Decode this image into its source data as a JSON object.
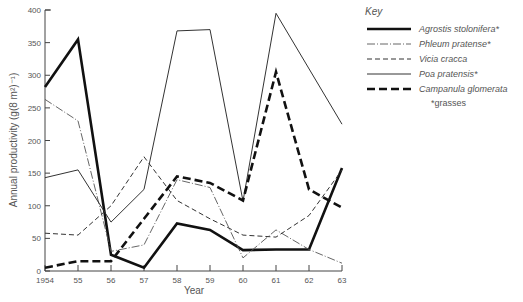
{
  "chart_data": {
    "type": "line",
    "title": "",
    "xlabel": "Year",
    "ylabel": "Annual productivity (g(8 m²)⁻¹)",
    "ylim": [
      0,
      400
    ],
    "yticks": [
      0,
      50,
      100,
      150,
      200,
      250,
      300,
      350,
      400
    ],
    "categories": [
      "1954",
      "55",
      "56",
      "57",
      "58",
      "59",
      "60",
      "61",
      "62",
      "63"
    ],
    "grid": false,
    "legend_position": "right",
    "legend_title": "Key",
    "legend_note": "*grasses",
    "series": [
      {
        "name": "Agrostis stolonifera*",
        "style": "thick-solid",
        "values": [
          282,
          355,
          25,
          5,
          73,
          63,
          32,
          33,
          33,
          158
        ]
      },
      {
        "name": "Phleum pratense*",
        "style": "dash-dot",
        "values": [
          263,
          230,
          30,
          40,
          140,
          128,
          20,
          63,
          33,
          12
        ]
      },
      {
        "name": "Vicia cracca",
        "style": "dashed",
        "values": [
          58,
          55,
          100,
          175,
          108,
          80,
          55,
          52,
          85,
          155
        ]
      },
      {
        "name": "Poa pratensis*",
        "style": "thin-solid",
        "values": [
          143,
          155,
          75,
          125,
          368,
          370,
          107,
          395,
          null,
          225
        ]
      },
      {
        "name": "Campanula glomerata",
        "style": "thick-dashed",
        "values": [
          5,
          15,
          15,
          80,
          145,
          135,
          108,
          305,
          125,
          97
        ]
      }
    ]
  },
  "key": {
    "title": "Key",
    "items": [
      {
        "label": "Agrostis stolonifera*"
      },
      {
        "label": "Phleum pratense*"
      },
      {
        "label": "Vicia cracca"
      },
      {
        "label": "Poa pratensis*"
      },
      {
        "label": "Campanula glomerata"
      }
    ],
    "note": "*grasses"
  },
  "axes": {
    "y_title": "Annual productivity (g(8 m²)⁻¹)",
    "x_title": "Year",
    "y_ticks": [
      "0",
      "50",
      "100",
      "150",
      "200",
      "250",
      "300",
      "350",
      "400"
    ],
    "x_ticks": [
      "1954",
      "55",
      "56",
      "57",
      "58",
      "59",
      "60",
      "61",
      "62",
      "63"
    ]
  }
}
